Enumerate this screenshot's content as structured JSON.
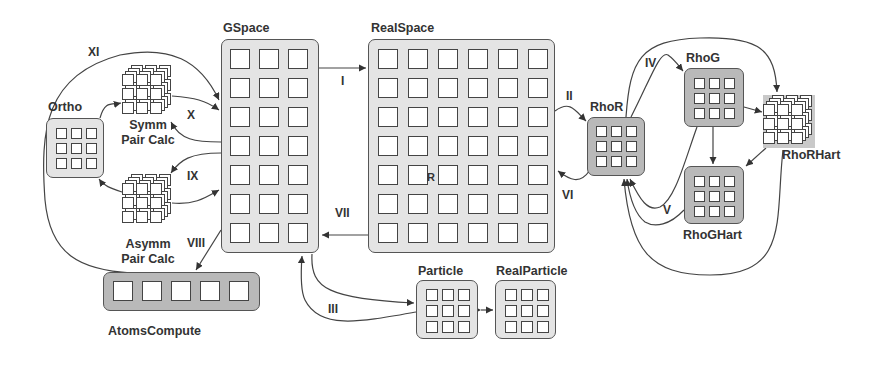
{
  "diagram": {
    "title": "",
    "nodes": {
      "gspace": {
        "label": "GSpace",
        "rows": 7,
        "cols": 3
      },
      "realspace": {
        "label": "RealSpace",
        "rows": 7,
        "cols": 6,
        "inner_mark": "R"
      },
      "ortho": {
        "label": "Ortho",
        "rows": 3,
        "cols": 3
      },
      "symm": {
        "label_line1": "Symm",
        "label_line2": "Pair Calc",
        "shape": "cube"
      },
      "asymm": {
        "label_line1": "Asymm",
        "label_line2": "Pair Calc",
        "shape": "cube"
      },
      "atoms": {
        "label": "AtomsCompute",
        "rows": 1,
        "cols": 5
      },
      "particle": {
        "label": "Particle",
        "rows": 3,
        "cols": 3
      },
      "realparticle": {
        "label": "RealParticle",
        "rows": 3,
        "cols": 3
      },
      "rhor": {
        "label": "RhoR",
        "rows": 3,
        "cols": 3
      },
      "rhog": {
        "label": "RhoG",
        "rows": 3,
        "cols": 3
      },
      "rhoghart": {
        "label": "RhoGHart",
        "rows": 3,
        "cols": 3
      },
      "rhorhart": {
        "label": "RhoRHart",
        "shape": "cube"
      }
    },
    "edge_labels": {
      "I": "I",
      "II": "II",
      "III": "III",
      "IV": "IV",
      "V": "V",
      "VI": "VI",
      "VII": "VII",
      "VIII": "VIII",
      "IX": "IX",
      "X": "X",
      "XI": "XI"
    },
    "edges": [
      {
        "from": "GSpace",
        "to": "RealSpace",
        "label": "I"
      },
      {
        "from": "RealSpace",
        "to": "RhoR",
        "label": "II"
      },
      {
        "from": "GSpace",
        "to": "Particle",
        "label": "III"
      },
      {
        "from": "RhoR",
        "to": "RhoG",
        "label": "IV"
      },
      {
        "from": "RhoGHart",
        "to": "RhoR",
        "label": "V"
      },
      {
        "from": "RhoR",
        "to": "RealSpace",
        "label": "VI"
      },
      {
        "from": "RealSpace",
        "to": "GSpace",
        "label": "VII"
      },
      {
        "from": "GSpace",
        "to": "AtomsCompute",
        "label": "VIII"
      },
      {
        "from": "GSpace",
        "to": "Asymm Pair Calc",
        "label": "IX"
      },
      {
        "from": "GSpace",
        "to": "Symm Pair Calc",
        "label": "X"
      },
      {
        "from": "AtomsCompute",
        "to": "GSpace",
        "label": "XI"
      },
      {
        "from": "Particle",
        "to": "RealParticle",
        "label": ""
      },
      {
        "from": "RhoG",
        "to": "RhoGHart",
        "label": ""
      },
      {
        "from": "RhoG",
        "to": "RhoRHart",
        "label": ""
      },
      {
        "from": "RhoR",
        "to": "RhoRHart",
        "label": ""
      },
      {
        "from": "RhoGHart",
        "to": "RhoRHart",
        "label": ""
      },
      {
        "from": "Ortho",
        "to": "Symm Pair Calc",
        "label": ""
      },
      {
        "from": "Asymm Pair Calc",
        "to": "Ortho",
        "label": ""
      }
    ],
    "colors": {
      "light_fill": "#e4e4e4",
      "dark_fill": "#b9b9b9",
      "stroke": "#444444"
    }
  }
}
